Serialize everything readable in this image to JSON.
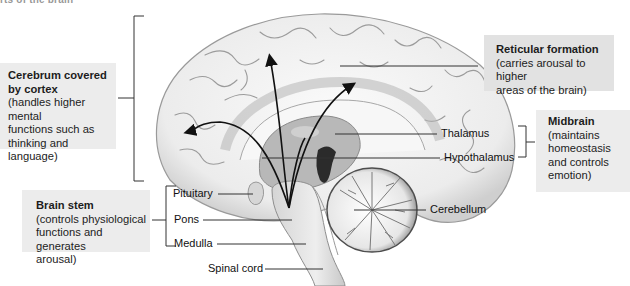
{
  "diagram": {
    "title_fragment": "rts of the brain",
    "boxes": {
      "cerebrum": {
        "title_line1": "Cerebrum covered",
        "title_line2": "by cortex",
        "desc_line1": "(handles higher mental",
        "desc_line2": "functions such as",
        "desc_line3": "thinking and language)"
      },
      "brain_stem": {
        "title": "Brain stem",
        "desc_line1": "(controls physiological",
        "desc_line2": "functions and generates",
        "desc_line3": "arousal)"
      },
      "reticular": {
        "title": "Reticular formation",
        "desc_line1": "(carries arousal to higher",
        "desc_line2": "areas of the brain)"
      },
      "midbrain": {
        "title": "Midbrain",
        "desc_line1": "(maintains",
        "desc_line2": "homeostasis",
        "desc_line3": "and controls",
        "desc_line4": "emotion)"
      }
    },
    "labels": {
      "thalamus": "Thalamus",
      "hypothalamus": "Hypothalamus",
      "pituitary": "Pituitary",
      "pons": "Pons",
      "medulla": "Medulla",
      "spinal_cord": "Spinal cord",
      "cerebellum": "Cerebellum"
    },
    "colors": {
      "box_fill": "#ececec",
      "line": "#333333",
      "brain_light": "#f4f4f4",
      "brain_mid": "#bdbdbd",
      "brain_dark": "#5a5a5a"
    }
  }
}
